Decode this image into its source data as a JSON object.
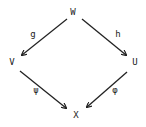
{
  "diagram": {
    "type": "commutative-square",
    "nodes": {
      "top": "W",
      "left": "V",
      "right": "U",
      "bottom": "X"
    },
    "arrows": [
      {
        "from": "W",
        "to": "V",
        "label": "g"
      },
      {
        "from": "W",
        "to": "U",
        "label": "h"
      },
      {
        "from": "V",
        "to": "X",
        "label": "ψ"
      },
      {
        "from": "U",
        "to": "X",
        "label": "φ"
      }
    ],
    "colors": {
      "ink": "#222222",
      "background": "#ffffff"
    }
  }
}
